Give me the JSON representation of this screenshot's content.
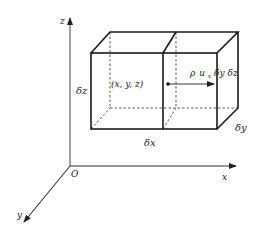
{
  "axes": {
    "z_label": "z",
    "x_label": "x",
    "y_label": "y",
    "origin_label": "O"
  },
  "dimensions": {
    "dz_label": "δz",
    "dx_label": "δx",
    "dy_label": "δy"
  },
  "point": {
    "label": "(x,  y,  z)"
  },
  "flux": {
    "rho": "ρ",
    "u": "u",
    "u_sub": "x",
    "rest": " δy δz"
  },
  "colors": {
    "line": "#1a1a1a",
    "axis": "#555555",
    "text": "#222222",
    "background": "#ffffff"
  }
}
